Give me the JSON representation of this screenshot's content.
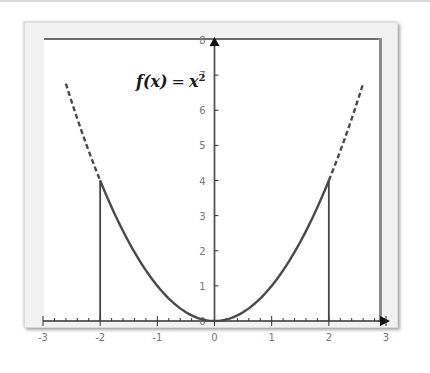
{
  "chart_data": {
    "type": "line",
    "title": "",
    "annotation": {
      "function": "f(x)",
      "equals": "=",
      "base": "x",
      "exponent": "2"
    },
    "xlabel": "",
    "ylabel": "",
    "xlim": [
      -3,
      3
    ],
    "ylim": [
      0,
      8
    ],
    "x_ticks": [
      -3,
      -2,
      -1,
      0,
      1,
      2,
      3
    ],
    "x_tick_labels": [
      "-3",
      "-2",
      "-1",
      "0",
      "1",
      "2",
      "3"
    ],
    "y_ticks": [
      0,
      1,
      2,
      3,
      4,
      5,
      6,
      7,
      8
    ],
    "y_tick_labels": [
      "0",
      "1",
      "2",
      "3",
      "4",
      "5",
      "6",
      "7",
      "8"
    ],
    "x_minor_step": 0.2,
    "grid": false,
    "series": [
      {
        "name": "f(x) = x^2 (solid)",
        "style": "solid",
        "function": "x^2",
        "domain": [
          -2,
          2
        ]
      },
      {
        "name": "f(x) = x^2 (dashed left)",
        "style": "dashed",
        "function": "x^2",
        "domain": [
          -2.6,
          -2
        ]
      },
      {
        "name": "f(x) = x^2 (dashed right)",
        "style": "dashed",
        "function": "x^2",
        "domain": [
          2,
          2.6
        ]
      }
    ],
    "vertical_lines": [
      {
        "x": -2,
        "y_from": 0,
        "y_to": 4
      },
      {
        "x": 2,
        "y_from": 0,
        "y_to": 4
      }
    ],
    "colors": {
      "curve": "#4a4a4a",
      "axis": "#333333",
      "frame": "#f2f2f2"
    }
  }
}
